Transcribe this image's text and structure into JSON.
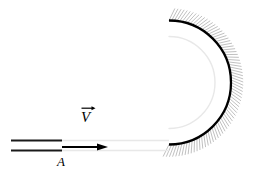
{
  "figure": {
    "type": "physics-schematic",
    "width": 254,
    "height": 176,
    "background_color": "#ffffff"
  },
  "labels": {
    "velocity": "V",
    "velocity_vector_notation": "arrow-over",
    "cross_section": "A"
  },
  "colors": {
    "wall_outer": "#000000",
    "wall_inner": "#e8e8e8",
    "channel_line": "#1a1a1a",
    "hatching": "#b9b9b9",
    "arrow": "#000000",
    "background": "#ffffff"
  },
  "geometry": {
    "channel": {
      "upper_wall": {
        "x1": 11,
        "y1": 140.5,
        "x2": 62,
        "y2": 140.5
      },
      "lower_wall": {
        "x1": 11,
        "y1": 150.5,
        "x2": 62,
        "y2": 150.5
      },
      "stroke_width": 2.2
    },
    "channel_faint_continuation": {
      "upper": {
        "x1": 62,
        "y1": 140.5,
        "x2": 169,
        "y2": 140.5
      },
      "lower": {
        "x1": 62,
        "y1": 150.5,
        "x2": 169,
        "y2": 150.5
      }
    },
    "velocity_arrow": {
      "x1": 62,
      "y1": 147,
      "x2": 108,
      "y2": 147,
      "head_length": 11,
      "head_width": 7,
      "stroke_width": 2.0
    },
    "bend_outer_arc": {
      "center_x": 169,
      "center_y": 82.5,
      "radius": 62,
      "start_angle_deg": -90,
      "end_angle_deg": 90,
      "stroke_width": 2.3,
      "side": "right"
    },
    "bend_inner_arc": {
      "center_x": 169,
      "center_y": 82.5,
      "radius": 46,
      "start_angle_deg": -90,
      "end_angle_deg": 90,
      "stroke_width": 1.4,
      "side": "right"
    },
    "hatching": {
      "inner_radius": 62,
      "outer_radius": 74,
      "line_count": 74,
      "stroke_width": 0.9,
      "skew_deg": 26
    }
  },
  "icons": {
    "vector_arrow": "right-arrow-over-symbol",
    "flow_arrow": "right-arrow"
  }
}
